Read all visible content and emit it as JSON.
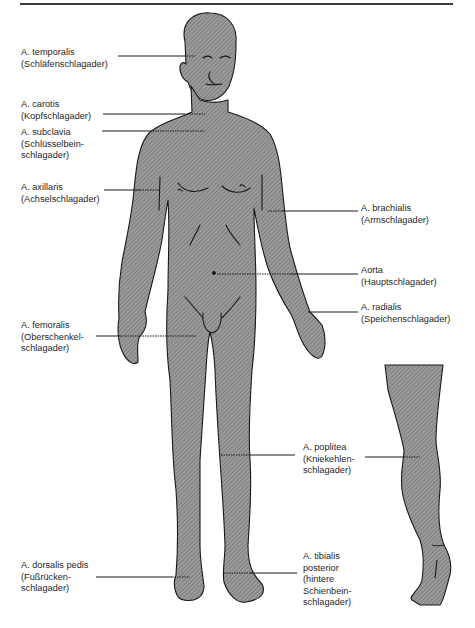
{
  "figure": {
    "type": "anatomical-diagram",
    "fill_color": "#8f8f8f",
    "outline_color": "#1a1a1a",
    "rule_color": "#3a3a3a"
  },
  "labels": {
    "temporalis": {
      "latin": "A. temporalis",
      "german": [
        "(Schläfenschlagader)"
      ]
    },
    "carotis": {
      "latin": "A. carotis",
      "german": [
        "(Kopfschlagader)"
      ]
    },
    "subclavia": {
      "latin": "A. subclavia",
      "german": [
        "(Schlüsselbein-",
        "schlagader)"
      ]
    },
    "axillaris": {
      "latin": "A. axillaris",
      "german": [
        "(Achselschlagader)"
      ]
    },
    "brachialis": {
      "latin": "A. brachialis",
      "german": [
        "(Armschlagader)"
      ]
    },
    "aorta": {
      "latin": "Aorta",
      "german": [
        "(Hauptschlagader)"
      ]
    },
    "radialis": {
      "latin": "A. radialis",
      "german": [
        "(Speichenschlagader)"
      ]
    },
    "femoralis": {
      "latin": "A. femoralis",
      "german": [
        "(Oberschenkel-",
        "schlagader)"
      ]
    },
    "poplitea": {
      "latin": "A. poplitea",
      "german": [
        "(Kniekehlen-",
        "schlagader)"
      ]
    },
    "dorsalis_pedis": {
      "latin": "A. dorsalis pedis",
      "german": [
        "(Fußrücken-",
        "schlagader)"
      ]
    },
    "tibialis_posterior": {
      "latin": "A. tibialis",
      "latin2": "posterior",
      "german": [
        "(hintere",
        "Schienbein-",
        "schlagader)"
      ]
    }
  }
}
